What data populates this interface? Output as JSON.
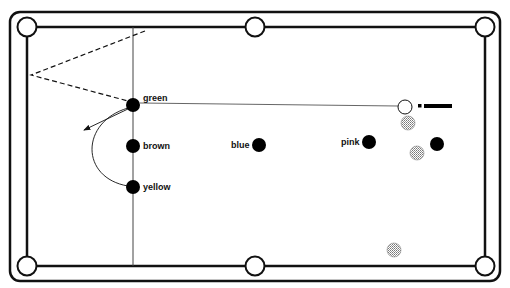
{
  "diagram": {
    "type": "snooker-table-shot",
    "colors": {
      "line": "#111111",
      "ball": "#000000",
      "cue_ball_fill": "#ffffff",
      "red_ball_fill": "#d0d0d0",
      "background": "#ffffff"
    },
    "table": {
      "outer_frame": {
        "x": 10,
        "y": 12,
        "width": 490,
        "height": 269,
        "radius": 10
      },
      "cushion": {
        "left": 27,
        "right": 485,
        "top": 27,
        "bottom": 266
      },
      "pockets": [
        {
          "name": "top-left",
          "cx": 27,
          "cy": 27
        },
        {
          "name": "top-middle",
          "cx": 255,
          "cy": 27
        },
        {
          "name": "top-right",
          "cx": 485,
          "cy": 27
        },
        {
          "name": "bottom-left",
          "cx": 27,
          "cy": 266
        },
        {
          "name": "bottom-middle",
          "cx": 255,
          "cy": 266
        },
        {
          "name": "bottom-right",
          "cx": 485,
          "cy": 266
        }
      ],
      "baulk_line_x": 133
    },
    "balls": {
      "green": {
        "label": "green",
        "cx": 133,
        "cy": 105
      },
      "brown": {
        "label": "brown",
        "cx": 133,
        "cy": 146
      },
      "yellow": {
        "label": "yellow",
        "cx": 133,
        "cy": 187
      },
      "blue": {
        "label": "blue",
        "cx": 259,
        "cy": 145
      },
      "pink": {
        "label": "pink",
        "cx": 369,
        "cy": 142
      },
      "black": {
        "label": "",
        "cx": 437,
        "cy": 144
      },
      "cue": {
        "cx": 405,
        "cy": 107
      },
      "reds": [
        {
          "cx": 408,
          "cy": 123
        },
        {
          "cx": 417,
          "cy": 153
        },
        {
          "cx": 394,
          "cy": 250
        }
      ]
    },
    "shot": {
      "cue_path": {
        "from": [
          398,
          106
        ],
        "to": [
          140,
          103
        ]
      },
      "dashed_path": [
        [
          145,
          31
        ],
        [
          31,
          75
        ],
        [
          128,
          101
        ]
      ],
      "arrow": {
        "from": [
          130,
          108
        ],
        "to": [
          84,
          130
        ]
      },
      "arc": {
        "from": [
          133,
          105
        ],
        "to": [
          133,
          187
        ],
        "leftmost_x": 93
      }
    }
  }
}
